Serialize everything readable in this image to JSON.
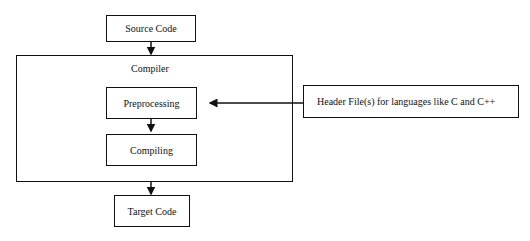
{
  "diagram": {
    "nodes": {
      "source_code": "Source Code",
      "compiler": "Compiler",
      "preprocessing": "Preprocessing",
      "compiling": "Compiling",
      "target_code": "Target Code",
      "header_files": "Header File(s) for languages like C and C++"
    },
    "edges": [
      {
        "from": "source_code",
        "to": "compiler"
      },
      {
        "from": "preprocessing",
        "to": "compiling"
      },
      {
        "from": "compiler",
        "to": "target_code"
      },
      {
        "from": "header_files",
        "to": "preprocessing"
      }
    ]
  }
}
